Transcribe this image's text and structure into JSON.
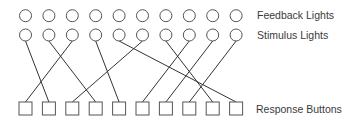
{
  "labels": {
    "feedback": "Feedback Lights",
    "stimulus": "Stimulus Lights",
    "response": "Response Buttons"
  },
  "layout": {
    "count": 10,
    "x_start": 25.5,
    "x_step": 23.4,
    "feedback_row_y": 15.7,
    "stimulus_row_y": 35,
    "circle_radius": 6,
    "button_top_y": 102,
    "button_size": 13
  },
  "colors": {
    "stroke": "#555555",
    "line": "#333333",
    "text": "#3a3a3a"
  },
  "connections": [
    {
      "stimulus": 1,
      "button": 2
    },
    {
      "stimulus": 2,
      "button": 4
    },
    {
      "stimulus": 3,
      "button": 1
    },
    {
      "stimulus": 4,
      "button": 5
    },
    {
      "stimulus": 5,
      "button": 10
    },
    {
      "stimulus": 6,
      "button": 3
    },
    {
      "stimulus": 7,
      "button": 9
    },
    {
      "stimulus": 8,
      "button": 6
    },
    {
      "stimulus": 9,
      "button": 7
    },
    {
      "stimulus": 10,
      "button": 8
    }
  ]
}
